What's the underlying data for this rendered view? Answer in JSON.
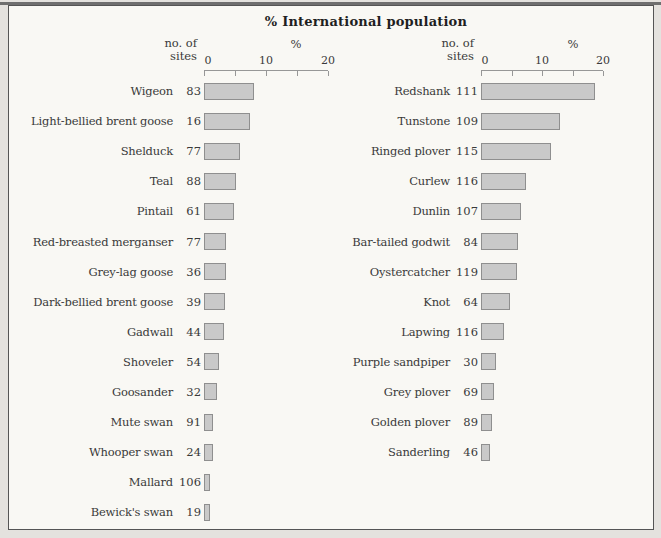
{
  "title": "% International population",
  "axis": {
    "header_line1": "no. of",
    "header_line2": "sites",
    "percent_label": "%",
    "tick_labels": [
      "0",
      "10",
      "20"
    ]
  },
  "colors": {
    "bar_fill": "#c9c9c9",
    "bar_border": "#8f8f8f",
    "frame_border": "#555555",
    "page_background": "#e4e2de",
    "panel_background": "#f9f8f4",
    "text": "#3a3a3a"
  },
  "chart_data": {
    "type": "bar",
    "orientation": "horizontal",
    "title": "% International population",
    "xlabel": "%",
    "xlim": [
      0,
      20
    ],
    "x_ticks": [
      0,
      5,
      10,
      15,
      20
    ],
    "x_tick_labels_shown": [
      "0",
      "10",
      "20"
    ],
    "panels": [
      {
        "name": "wildfowl",
        "col_header": "no. of sites",
        "rows": [
          {
            "label": "Wigeon",
            "sites": 83,
            "pct": 8.0
          },
          {
            "label": "Light-bellied brent goose",
            "sites": 16,
            "pct": 7.4
          },
          {
            "label": "Shelduck",
            "sites": 77,
            "pct": 5.8
          },
          {
            "label": "Teal",
            "sites": 88,
            "pct": 5.1
          },
          {
            "label": "Pintail",
            "sites": 61,
            "pct": 4.8
          },
          {
            "label": "Red-breasted merganser",
            "sites": 77,
            "pct": 3.5
          },
          {
            "label": "Grey-lag goose",
            "sites": 36,
            "pct": 3.5
          },
          {
            "label": "Dark-bellied brent goose",
            "sites": 39,
            "pct": 3.3
          },
          {
            "label": "Gadwall",
            "sites": 44,
            "pct": 3.2
          },
          {
            "label": "Shoveler",
            "sites": 54,
            "pct": 2.4
          },
          {
            "label": "Goosander",
            "sites": 32,
            "pct": 2.1
          },
          {
            "label": "Mute swan",
            "sites": 91,
            "pct": 1.4
          },
          {
            "label": "Whooper swan",
            "sites": 24,
            "pct": 1.4
          },
          {
            "label": "Mallard",
            "sites": 106,
            "pct": 1.0
          },
          {
            "label": "Bewick's swan",
            "sites": 19,
            "pct": 1.0
          }
        ]
      },
      {
        "name": "waders",
        "col_header": "no. of sites",
        "rows": [
          {
            "label": "Redshank",
            "sites": 111,
            "pct": 18.7
          },
          {
            "label": "Tunstone",
            "sites": 109,
            "pct": 13.0
          },
          {
            "label": "Ringed plover",
            "sites": 115,
            "pct": 11.5
          },
          {
            "label": "Curlew",
            "sites": 116,
            "pct": 7.4
          },
          {
            "label": "Dunlin",
            "sites": 107,
            "pct": 6.6
          },
          {
            "label": "Bar-tailed godwit",
            "sites": 84,
            "pct": 6.1
          },
          {
            "label": "Oystercatcher",
            "sites": 119,
            "pct": 5.9
          },
          {
            "label": "Knot",
            "sites": 64,
            "pct": 4.8
          },
          {
            "label": "Lapwing",
            "sites": 116,
            "pct": 3.7
          },
          {
            "label": "Purple sandpiper",
            "sites": 30,
            "pct": 2.5
          },
          {
            "label": "Grey plover",
            "sites": 69,
            "pct": 2.1
          },
          {
            "label": "Golden plover",
            "sites": 89,
            "pct": 1.8
          },
          {
            "label": "Sanderling",
            "sites": 46,
            "pct": 1.5
          }
        ]
      }
    ]
  }
}
